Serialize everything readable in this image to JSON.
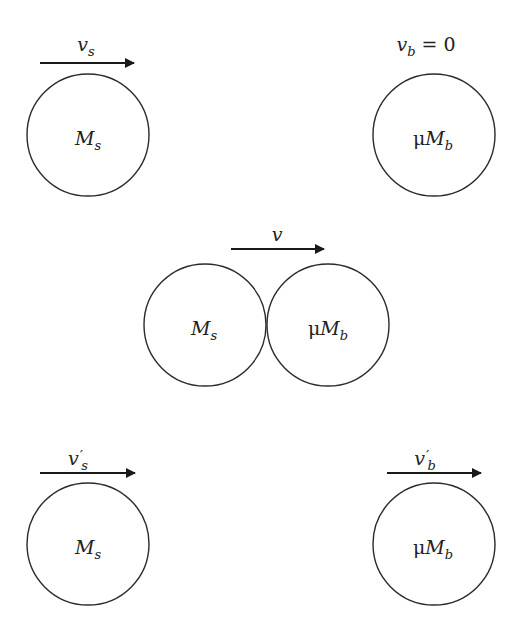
{
  "colors": {
    "stroke": "#2a2a2a",
    "background": "#ffffff"
  },
  "stages": [
    {
      "name": "before-collision",
      "bodies": [
        {
          "mass": {
            "prefix": "",
            "symbol": "M",
            "sub": "s"
          },
          "velocity": {
            "symbol": "v",
            "sub": "s",
            "prime": "",
            "suffix": "",
            "arrow": true
          }
        },
        {
          "mass": {
            "prefix": "μ",
            "symbol": "M",
            "sub": "b"
          },
          "velocity": {
            "symbol": "v",
            "sub": "b",
            "prime": "",
            "suffix": " = 0",
            "arrow": false
          }
        }
      ]
    },
    {
      "name": "during-collision",
      "bodies": [
        {
          "mass": {
            "prefix": "",
            "symbol": "M",
            "sub": "s"
          }
        },
        {
          "mass": {
            "prefix": "μ",
            "symbol": "M",
            "sub": "b"
          }
        }
      ],
      "velocity": {
        "symbol": "v",
        "sub": "",
        "prime": "",
        "suffix": "",
        "arrow": true
      }
    },
    {
      "name": "after-collision",
      "bodies": [
        {
          "mass": {
            "prefix": "",
            "symbol": "M",
            "sub": "s"
          },
          "velocity": {
            "symbol": "v",
            "sub": "s",
            "prime": "′",
            "suffix": "",
            "arrow": true
          }
        },
        {
          "mass": {
            "prefix": "μ",
            "symbol": "M",
            "sub": "b"
          },
          "velocity": {
            "symbol": "v",
            "sub": "b",
            "prime": "′",
            "suffix": "",
            "arrow": true
          }
        }
      ]
    }
  ]
}
